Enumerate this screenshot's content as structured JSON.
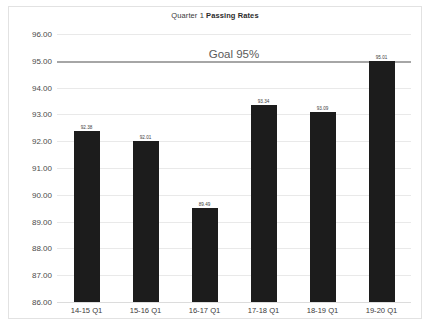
{
  "chart_data": {
    "type": "bar",
    "title": "Quarter 1 Passing Rates",
    "title_prefix": "Quarter 1 ",
    "title_emphasis": "Passing Rates",
    "xlabel": "",
    "ylabel": "",
    "ylim": [
      86.0,
      96.0
    ],
    "ystep": 1.0,
    "grid": true,
    "legend": "none",
    "categories": [
      "14-15 Q1",
      "15-16 Q1",
      "16-17 Q1",
      "17-18 Q1",
      "18-19 Q1",
      "19-20 Q1"
    ],
    "values": [
      92.38,
      92.01,
      89.49,
      93.34,
      93.09,
      95.01
    ],
    "value_labels": [
      "92.38",
      "92.01",
      "89.49",
      "93.34",
      "93.09",
      "95.01"
    ],
    "ytick_labels": [
      "96.00",
      "95.00",
      "94.00",
      "93.00",
      "92.00",
      "91.00",
      "90.00",
      "89.00",
      "88.00",
      "87.00",
      "86.00"
    ],
    "ytick_values": [
      96.0,
      95.0,
      94.0,
      93.0,
      92.0,
      91.0,
      90.0,
      89.0,
      88.0,
      87.0,
      86.0
    ],
    "annotations": [
      {
        "name": "goal-line",
        "label": "Goal 95%",
        "value": 95.0
      }
    ],
    "bar_color": "#1c1c1c",
    "grid_color": "#e9e9e9",
    "goal_line_color": "#a6a6a6",
    "border_color": "#e2e2e2",
    "background": "#ffffff"
  }
}
